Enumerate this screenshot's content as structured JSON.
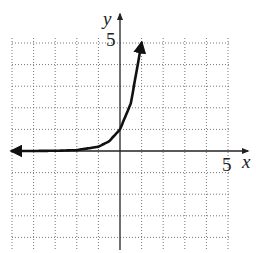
{
  "chart_data": {
    "type": "line",
    "title": "",
    "xlabel": "x",
    "ylabel": "y",
    "xlim": [
      -5,
      5
    ],
    "ylim": [
      -4.5,
      5
    ],
    "grid": true,
    "grid_style": "dotted",
    "tick_labels": {
      "x": [
        "5"
      ],
      "y": [
        "5"
      ]
    },
    "series": [
      {
        "name": "exponential curve",
        "description": "increasing exponential, horizontal asymptote y=0 to the left, arrow at both ends",
        "x": [
          -5,
          -4,
          -3,
          -2,
          -1,
          -0.5,
          0,
          0.5,
          1
        ],
        "y": [
          0.0,
          0.0,
          0.01,
          0.04,
          0.2,
          0.45,
          1.0,
          2.2,
          5.0
        ]
      }
    ]
  },
  "labels": {
    "x_axis": "x",
    "y_axis": "y",
    "x_tick": "5",
    "y_tick": "5"
  }
}
